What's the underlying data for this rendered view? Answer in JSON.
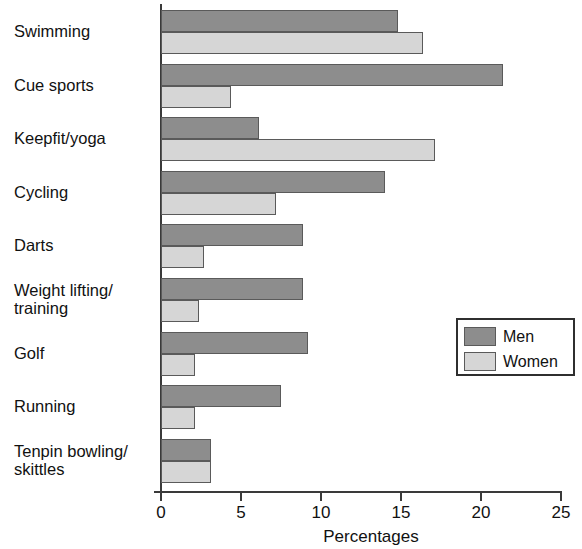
{
  "chart_data": {
    "type": "bar",
    "orientation": "horizontal",
    "title": "",
    "xlabel": "Percentages",
    "ylabel": "",
    "xlim": [
      0,
      25
    ],
    "xticks": [
      0,
      5,
      10,
      15,
      20,
      25
    ],
    "xtick_labels": [
      "0",
      "5",
      "10",
      "15",
      "20",
      "25"
    ],
    "grid": false,
    "legend_position": "center-right",
    "categories": [
      "Swimming",
      "Cue sports",
      "Keepfit/yoga",
      "Cycling",
      "Darts",
      "Weight lifting/\ntraining",
      "Golf",
      "Running",
      "Tenpin bowling/\nskittles"
    ],
    "series": [
      {
        "name": "Men",
        "color": "#8d8d8d",
        "values": [
          14.8,
          21.4,
          6.1,
          14.0,
          8.9,
          8.9,
          9.2,
          7.5,
          3.1
        ]
      },
      {
        "name": "Women",
        "color": "#d6d6d6",
        "values": [
          16.4,
          4.4,
          17.1,
          7.2,
          2.7,
          2.4,
          2.1,
          2.1,
          3.1
        ]
      }
    ]
  },
  "legend": {
    "entries": [
      {
        "label": "Men",
        "swatch": "men"
      },
      {
        "label": "Women",
        "swatch": "women"
      }
    ]
  },
  "axis": {
    "x_title": "Percentages"
  }
}
